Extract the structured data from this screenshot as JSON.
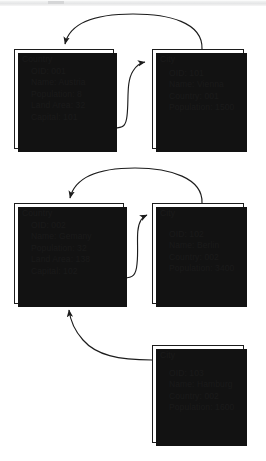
{
  "figure": {
    "type": "object-diagram"
  },
  "objects": [
    {
      "id": "country-1",
      "class_label": "Country",
      "attributes": [
        "OID: 001",
        "Name: Austria",
        "Population: 8",
        "Land Area: 32",
        "Capital: 101"
      ]
    },
    {
      "id": "city-1",
      "class_label": "City",
      "attributes": [
        "OID: 101",
        "Name: Vienna",
        "Country: 001",
        "Population: 1500"
      ]
    },
    {
      "id": "country-2",
      "class_label": "Country",
      "attributes": [
        "OID: 002",
        "Name: Gemany",
        "Population: 32",
        "Land Area: 138",
        "Capital: 102"
      ]
    },
    {
      "id": "city-2",
      "class_label": "City",
      "attributes": [
        "OID: 102",
        "Name: Berlin",
        "Country: 002",
        "Population:  3400"
      ]
    },
    {
      "id": "city-3",
      "class_label": "City",
      "attributes": [
        "OID: 103",
        "Name: Hamburg",
        "Country: 002",
        "Population:  1600"
      ]
    }
  ],
  "links": [
    {
      "id": "link-1",
      "from": "city-1",
      "to": "country-1",
      "shape": "arc-over-top"
    },
    {
      "id": "link-2",
      "from": "country-1",
      "to": "city-1",
      "shape": "s-curve-right"
    },
    {
      "id": "link-3",
      "from": "city-2",
      "to": "country-2",
      "shape": "arc-over-top"
    },
    {
      "id": "link-4",
      "from": "country-2",
      "to": "city-2",
      "shape": "s-curve-right"
    },
    {
      "id": "link-5",
      "from": "city-3",
      "to": "country-2",
      "shape": "curve-up-left"
    }
  ],
  "colors": {
    "stroke": "#1c1c1c",
    "box_fill": "#ffffff",
    "shadow": "#121212",
    "background": "#ffffff"
  }
}
